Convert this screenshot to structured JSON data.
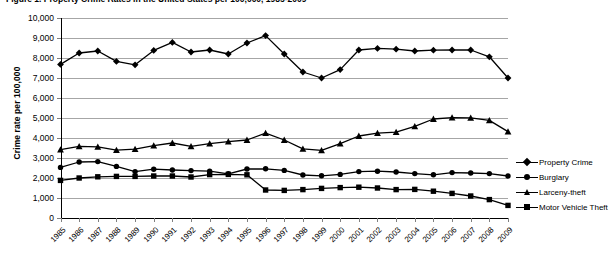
{
  "chart_title": "Figure 1. Property Crime Rates in the United States per 100,000, 1985-2009",
  "axis": {
    "y_title": "Crime rate per 100,000",
    "y_ticks": [
      "10,000",
      "9,000",
      "8,000",
      "7,000",
      "6,000",
      "5,000",
      "4,000",
      "3,000",
      "2,000",
      "1,000",
      "0"
    ],
    "y_min": 0,
    "y_max": 10000,
    "y_step": 1000
  },
  "legend": {
    "position": "right",
    "items": [
      {
        "label": "Property Crime",
        "marker": "diamond-marker",
        "color": "#000000"
      },
      {
        "label": "Burglary",
        "marker": "circle-marker",
        "color": "#000000"
      },
      {
        "label": "Larceny-theft",
        "marker": "triangle-marker",
        "color": "#000000"
      },
      {
        "label": "Motor Vehicle Theft",
        "marker": "square-marker",
        "color": "#000000"
      }
    ]
  },
  "chart_data": {
    "type": "line",
    "title": "Figure 1. Property Crime Rates in the United States per 100,000, 1985-2009",
    "xlabel": "",
    "ylabel": "Crime rate per 100,000",
    "ylim": [
      0,
      10000
    ],
    "ytick_step": 1000,
    "grid": true,
    "legend_position": "right",
    "categories": [
      "1985",
      "1986",
      "1987",
      "1988",
      "1989",
      "1990",
      "1991",
      "1992",
      "1993",
      "1994",
      "1995",
      "1996",
      "1997",
      "1998",
      "1999",
      "2000",
      "2001",
      "2002",
      "2003",
      "2004",
      "2005",
      "2006",
      "2007",
      "2008",
      "2009"
    ],
    "series": [
      {
        "name": "Property Crime",
        "marker": "diamond",
        "values": [
          7680,
          8250,
          8350,
          7830,
          7660,
          8380,
          8780,
          8300,
          8400,
          8200,
          8750,
          9120,
          8200,
          7300,
          7000,
          7420,
          8400,
          8480,
          8440,
          8350,
          8390,
          8400,
          8400,
          8060,
          7000
        ]
      },
      {
        "name": "Burglary",
        "marker": "circle",
        "values": [
          2530,
          2800,
          2820,
          2580,
          2320,
          2440,
          2400,
          2370,
          2340,
          2210,
          2450,
          2460,
          2380,
          2150,
          2110,
          2180,
          2320,
          2340,
          2300,
          2220,
          2160,
          2270,
          2250,
          2220,
          2100
        ]
      },
      {
        "name": "Larceny-theft",
        "marker": "triangle",
        "values": [
          3420,
          3580,
          3560,
          3390,
          3440,
          3620,
          3750,
          3580,
          3720,
          3820,
          3900,
          4240,
          3900,
          3460,
          3380,
          3720,
          4100,
          4240,
          4290,
          4580,
          4950,
          5020,
          5010,
          4880,
          4320
        ]
      },
      {
        "name": "Motor Vehicle Theft",
        "marker": "square",
        "values": [
          1880,
          2000,
          2060,
          2080,
          2080,
          2100,
          2100,
          2050,
          2170,
          2180,
          2160,
          1400,
          1380,
          1420,
          1480,
          1520,
          1540,
          1500,
          1420,
          1430,
          1340,
          1230,
          1100,
          920,
          630
        ]
      }
    ]
  }
}
